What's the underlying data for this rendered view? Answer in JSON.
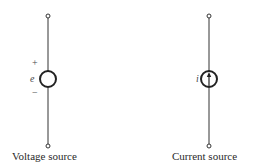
{
  "diagram": {
    "colors": {
      "stroke": "#333333",
      "background": "#ffffff"
    },
    "voltage_source": {
      "label": "Voltage source",
      "variable": "e",
      "plus_sign": "+",
      "minus_sign": "−",
      "icon": "voltage-source-circle-icon"
    },
    "current_source": {
      "label": "Current source",
      "variable": "i",
      "icon": "current-source-circle-arrow-icon"
    }
  }
}
